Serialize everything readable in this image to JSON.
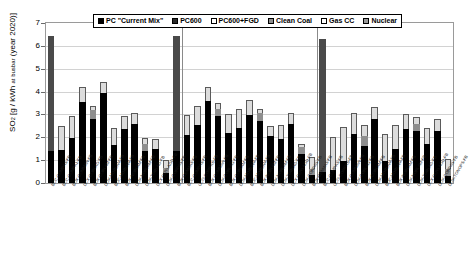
{
  "chart_data": {
    "type": "bar",
    "title": "",
    "xlabel": "",
    "ylabel": "SO2 [g / kWh at busbar (year 2020)]",
    "ylim": [
      0,
      7
    ],
    "yticks": [
      0,
      1,
      2,
      3,
      4,
      5,
      6,
      7
    ],
    "grid": true,
    "stacked": true,
    "legend_position": "top-center",
    "legend": [
      {
        "label": "PC \"Current Mix\"",
        "swatch": "#000000"
      },
      {
        "label": "PC600",
        "swatch": "#2b2b2b"
      },
      {
        "label": "PC600+FGD",
        "swatch": "#ffffff"
      },
      {
        "label": "Clean Coal",
        "swatch": "#8e8e8e"
      },
      {
        "label": "Gas CC",
        "swatch": "#fdfdfd"
      },
      {
        "label": "Nuclear",
        "swatch": "#9a9a9a"
      }
    ],
    "group_separators": [
      13,
      26
    ],
    "categories": [
      "BCC-COMPAS-FB",
      "BCC-COMPA1-FB",
      "BOX-COMMAN-FB",
      "DCX-CORLAG-FB",
      "BOX-CORLAM-FB",
      "DOX-MORLAM-FB",
      "BOC-MORLAM-FB",
      "BOX-NORLAM-FB",
      "DOX-NORLAM-FB",
      "DOX-TORLAG-FB",
      "DCX-DOYLAGD-FB",
      "DOX-CORPAS-FB",
      "BOX-CENMAS-FB",
      "BCC-COMPAS-FB",
      "UCO-COMPAS-FB",
      "BOX-COMMAN-FB",
      "DOX-CORLAG-FB",
      "BOX-CORLAM-FB",
      "DOX-MORLAM-FB",
      "BOC-MORLAM-FB",
      "BOX-NORLAM-FB",
      "DOX-NORLAM-FB",
      "DOX-TORLAG-FB",
      "DCX-DOYLAGD-FB",
      "DOX-CORPAS-FB",
      "BOX-CENMAS-FB",
      "BCC-COMPAS-FB",
      "UCO-COMPAS-FB",
      "BOX-COMMAN-FB",
      "DOX-CORLAG-FB",
      "BOX-CORLAM-FB",
      "DOX-MORLAM-FB",
      "BOC-MORLAM-FB",
      "BOX-NORLAM-FB",
      "DOX-NORLAM-FB",
      "DOX-TORLAG-FB",
      "DCX-DOYLAGD-FB",
      "DOX-CORPAS-FB",
      "DOX-TONOPS-FB"
    ],
    "bars": [
      {
        "segments": [
          {
            "value": 1.42,
            "style": "black"
          },
          {
            "value": 5.03,
            "style": "dark"
          }
        ],
        "total": 6.45
      },
      {
        "segments": [
          {
            "value": 1.43,
            "style": "black"
          },
          {
            "value": 1.05,
            "style": "light"
          }
        ],
        "total": 2.48
      },
      {
        "segments": [
          {
            "value": 1.96,
            "style": "black"
          },
          {
            "value": 0.96,
            "style": "light"
          }
        ],
        "total": 2.92
      },
      {
        "segments": [
          {
            "value": 3.54,
            "style": "black"
          },
          {
            "value": 0.67,
            "style": "light"
          }
        ],
        "total": 4.21
      },
      {
        "segments": [
          {
            "value": 2.79,
            "style": "black"
          },
          {
            "value": 0.4,
            "style": "mid"
          },
          {
            "value": 0.17,
            "style": "light"
          }
        ],
        "total": 3.36
      },
      {
        "segments": [
          {
            "value": 3.92,
            "style": "black"
          },
          {
            "value": 0.52,
            "style": "light"
          }
        ],
        "total": 4.44
      },
      {
        "segments": [
          {
            "value": 1.66,
            "style": "black"
          },
          {
            "value": 0.74,
            "style": "light"
          }
        ],
        "total": 2.4
      },
      {
        "segments": [
          {
            "value": 2.37,
            "style": "black"
          },
          {
            "value": 0.57,
            "style": "light"
          }
        ],
        "total": 2.94
      },
      {
        "segments": [
          {
            "value": 2.59,
            "style": "black"
          },
          {
            "value": 0.48,
            "style": "light"
          }
        ],
        "total": 3.07
      },
      {
        "segments": [
          {
            "value": 1.41,
            "style": "black"
          },
          {
            "value": 0.3,
            "style": "mid"
          },
          {
            "value": 0.27,
            "style": "light"
          }
        ],
        "total": 1.98
      },
      {
        "segments": [
          {
            "value": 1.5,
            "style": "black"
          },
          {
            "value": 0.41,
            "style": "light"
          }
        ],
        "total": 1.91
      },
      {
        "segments": [
          {
            "value": 0.43,
            "style": "black"
          },
          {
            "value": 0.22,
            "style": "mid"
          },
          {
            "value": 0.38,
            "style": "light"
          }
        ],
        "total": 1.03
      },
      {
        "segments": [
          {
            "value": 1.4,
            "style": "black"
          },
          {
            "value": 5.03,
            "style": "dark"
          }
        ],
        "total": 6.43
      },
      {
        "segments": [
          {
            "value": 2.09,
            "style": "black"
          },
          {
            "value": 0.9,
            "style": "light"
          }
        ],
        "total": 2.99
      },
      {
        "segments": [
          {
            "value": 2.56,
            "style": "black"
          },
          {
            "value": 0.83,
            "style": "light"
          }
        ],
        "total": 3.39
      },
      {
        "segments": [
          {
            "value": 3.58,
            "style": "black"
          },
          {
            "value": 0.64,
            "style": "light"
          }
        ],
        "total": 4.22
      },
      {
        "segments": [
          {
            "value": 2.93,
            "style": "black"
          },
          {
            "value": 0.32,
            "style": "mid"
          },
          {
            "value": 0.25,
            "style": "light"
          }
        ],
        "total": 3.5
      },
      {
        "segments": [
          {
            "value": 2.18,
            "style": "black"
          },
          {
            "value": 0.84,
            "style": "light"
          }
        ],
        "total": 3.02
      },
      {
        "segments": [
          {
            "value": 2.4,
            "style": "black"
          },
          {
            "value": 0.86,
            "style": "light"
          }
        ],
        "total": 3.26
      },
      {
        "segments": [
          {
            "value": 2.96,
            "style": "black"
          },
          {
            "value": 0.67,
            "style": "light"
          }
        ],
        "total": 3.63
      },
      {
        "segments": [
          {
            "value": 2.73,
            "style": "black"
          },
          {
            "value": 0.34,
            "style": "mid"
          },
          {
            "value": 0.17,
            "style": "light"
          }
        ],
        "total": 3.24
      },
      {
        "segments": [
          {
            "value": 2.05,
            "style": "black"
          },
          {
            "value": 0.44,
            "style": "light"
          }
        ],
        "total": 2.49
      },
      {
        "segments": [
          {
            "value": 1.92,
            "style": "black"
          },
          {
            "value": 0.62,
            "style": "light"
          }
        ],
        "total": 2.54
      },
      {
        "segments": [
          {
            "value": 2.58,
            "style": "black"
          },
          {
            "value": 0.48,
            "style": "light"
          }
        ],
        "total": 3.06
      },
      {
        "segments": [
          {
            "value": 1.26,
            "style": "black"
          },
          {
            "value": 0.32,
            "style": "mid"
          },
          {
            "value": 0.15,
            "style": "light"
          }
        ],
        "total": 1.73
      },
      {
        "segments": [
          {
            "value": 0.35,
            "style": "black"
          },
          {
            "value": 0.28,
            "style": "mid"
          },
          {
            "value": 0.5,
            "style": "light"
          }
        ],
        "total": 1.13
      },
      {
        "segments": [
          {
            "value": 0.5,
            "style": "black"
          },
          {
            "value": 5.8,
            "style": "dark"
          }
        ],
        "total": 6.3
      },
      {
        "segments": [
          {
            "value": 0.57,
            "style": "black"
          },
          {
            "value": 1.43,
            "style": "light"
          }
        ],
        "total": 2.0
      },
      {
        "segments": [
          {
            "value": 0.97,
            "style": "black"
          },
          {
            "value": 1.47,
            "style": "light"
          }
        ],
        "total": 2.44
      },
      {
        "segments": [
          {
            "value": 2.16,
            "style": "black"
          },
          {
            "value": 0.92,
            "style": "light"
          }
        ],
        "total": 3.08
      },
      {
        "segments": [
          {
            "value": 1.62,
            "style": "black"
          },
          {
            "value": 0.42,
            "style": "mid"
          },
          {
            "value": 0.5,
            "style": "light"
          }
        ],
        "total": 2.54
      },
      {
        "segments": [
          {
            "value": 2.78,
            "style": "black"
          },
          {
            "value": 0.54,
            "style": "light"
          }
        ],
        "total": 3.32
      },
      {
        "segments": [
          {
            "value": 0.96,
            "style": "black"
          },
          {
            "value": 1.19,
            "style": "light"
          }
        ],
        "total": 2.15
      },
      {
        "segments": [
          {
            "value": 1.48,
            "style": "black"
          },
          {
            "value": 1.06,
            "style": "light"
          }
        ],
        "total": 2.54
      },
      {
        "segments": [
          {
            "value": 2.36,
            "style": "black"
          },
          {
            "value": 0.68,
            "style": "light"
          }
        ],
        "total": 3.04
      },
      {
        "segments": [
          {
            "value": 2.28,
            "style": "black"
          },
          {
            "value": 0.3,
            "style": "mid"
          },
          {
            "value": 0.3,
            "style": "light"
          }
        ],
        "total": 2.88
      },
      {
        "segments": [
          {
            "value": 1.72,
            "style": "black"
          },
          {
            "value": 0.68,
            "style": "light"
          }
        ],
        "total": 2.4
      },
      {
        "segments": [
          {
            "value": 2.26,
            "style": "black"
          },
          {
            "value": 0.52,
            "style": "light"
          }
        ],
        "total": 2.78
      },
      {
        "segments": [
          {
            "value": 0.3,
            "style": "black"
          },
          {
            "value": 0.3,
            "style": "mid"
          },
          {
            "value": 0.45,
            "style": "light"
          }
        ],
        "total": 1.05
      }
    ]
  }
}
